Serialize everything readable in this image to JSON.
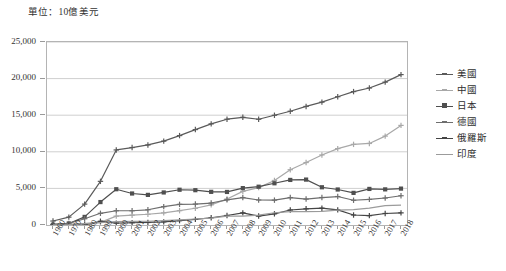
{
  "caption": "單位：10億美元",
  "legend": {
    "position": "right",
    "entries": [
      {
        "label": "美國",
        "color": "#5a5a5a",
        "marker": "cross"
      },
      {
        "label": "中國",
        "color": "#a8a8a8",
        "marker": "cross"
      },
      {
        "label": "日本",
        "color": "#4f4f4f",
        "marker": "square"
      },
      {
        "label": "德國",
        "color": "#6e6e6e",
        "marker": "cross"
      },
      {
        "label": "俄羅斯",
        "color": "#454545",
        "marker": "cross"
      },
      {
        "label": "印度",
        "color": "#9b9b9b",
        "marker": "line"
      }
    ]
  },
  "chart_data": {
    "type": "line",
    "title": "",
    "subtitle": "",
    "xlabel": "",
    "ylabel": "",
    "unit_note": "單位：10億美元",
    "grid": true,
    "ylim": [
      0,
      25000
    ],
    "yticks": [
      0,
      5000,
      10000,
      15000,
      20000,
      25000
    ],
    "ytick_labels": [
      "0",
      "5,000",
      "10,000",
      "15,000",
      "20,000",
      "25,000"
    ],
    "categories": [
      "1960",
      "1970",
      "1980",
      "1990",
      "2000",
      "2001",
      "2002",
      "2003",
      "2004",
      "2005",
      "2006",
      "2007",
      "2008",
      "2009",
      "2010",
      "2011",
      "2012",
      "2013",
      "2014",
      "2015",
      "2016",
      "2017",
      "2018"
    ],
    "series": [
      {
        "name": "美國",
        "color": "#5a5a5a",
        "marker": "cross",
        "values": [
          543,
          1073,
          2857,
          5963,
          10252,
          10582,
          10936,
          11458,
          12214,
          13037,
          13815,
          14452,
          14713,
          14449,
          14992,
          15543,
          16197,
          16785,
          17527,
          18225,
          18715,
          19519,
          20544
        ]
      },
      {
        "name": "中國",
        "color": "#a8a8a8",
        "marker": "cross",
        "values": [
          60,
          93,
          191,
          361,
          1211,
          1339,
          1471,
          1660,
          1955,
          2286,
          2752,
          3550,
          4594,
          5102,
          6087,
          7552,
          8532,
          9570,
          10438,
          11016,
          11138,
          12143,
          13608
        ]
      },
      {
        "name": "日本",
        "color": "#4f4f4f",
        "marker": "square",
        "values": [
          44,
          213,
          1105,
          3133,
          4888,
          4303,
          4115,
          4446,
          4815,
          4755,
          4530,
          4515,
          5038,
          5231,
          5700,
          6157,
          6203,
          5156,
          4850,
          4390,
          4927,
          4867,
          4971
        ]
      },
      {
        "name": "德國",
        "color": "#6e6e6e",
        "marker": "cross",
        "values": [
          92,
          216,
          853,
          1598,
          1949,
          1945,
          2079,
          2505,
          2819,
          2861,
          3002,
          3440,
          3752,
          3418,
          3397,
          3748,
          3544,
          3753,
          3890,
          3383,
          3496,
          3690,
          3997
        ]
      },
      {
        "name": "俄羅斯",
        "color": "#454545",
        "marker": "cross",
        "values": [
          0,
          0,
          0,
          517,
          260,
          307,
          345,
          430,
          591,
          764,
          990,
          1300,
          1661,
          1223,
          1525,
          2051,
          2210,
          2297,
          2064,
          1366,
          1277,
          1574,
          1658
        ]
      },
      {
        "name": "印度",
        "color": "#9b9b9b",
        "marker": "line",
        "values": [
          37,
          62,
          186,
          321,
          468,
          485,
          515,
          607,
          709,
          820,
          940,
          1217,
          1199,
          1342,
          1676,
          1823,
          1828,
          1857,
          2039,
          2104,
          2295,
          2653,
          2726
        ]
      }
    ]
  }
}
